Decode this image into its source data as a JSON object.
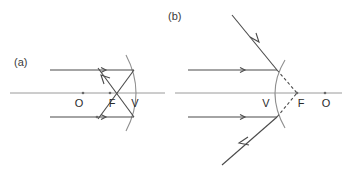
{
  "figure": {
    "width": 351,
    "height": 175,
    "background_color": "#ffffff",
    "line_color": "#4a4a4a",
    "axis_color": "#9a9a9a",
    "mirror_color": "#8f8f8f",
    "label_color": "#2b2b2b"
  },
  "panels": [
    {
      "id": "a",
      "label": "(a)",
      "mirror_type": "concave",
      "description": "Parallel rays reflect off a concave mirror and converge through the real focal point F between the vertex V and the center O.",
      "axis_label": "principal-axis",
      "points": [
        {
          "name": "O",
          "label": "O",
          "role": "center-of-curvature-side-point",
          "x": 83,
          "y": 93
        },
        {
          "name": "F",
          "label": "F",
          "role": "focal-point",
          "x": 110,
          "y": 93
        },
        {
          "name": "V",
          "label": "V",
          "role": "vertex",
          "x": 132,
          "y": 93
        }
      ],
      "rays": [
        {
          "name": "incident-ray-upper",
          "style": "solid",
          "direction": "rightward"
        },
        {
          "name": "incident-ray-lower",
          "style": "solid",
          "direction": "rightward"
        },
        {
          "name": "reflected-ray-upper",
          "style": "solid",
          "direction": "down-left-through-F"
        },
        {
          "name": "reflected-ray-lower",
          "style": "solid",
          "direction": "up-left-through-F"
        }
      ]
    },
    {
      "id": "b",
      "label": "(b)",
      "mirror_type": "convex",
      "description": "Parallel rays reflect off a convex mirror and diverge; their backward extensions (dashed) meet at the virtual focal point F behind the mirror, with O further right.",
      "axis_label": "principal-axis",
      "points": [
        {
          "name": "V",
          "label": "V",
          "role": "vertex",
          "x": 268,
          "y": 93
        },
        {
          "name": "F",
          "label": "F",
          "role": "virtual-focal-point",
          "x": 297,
          "y": 93
        },
        {
          "name": "O",
          "label": "O",
          "role": "center-of-curvature-side-point",
          "x": 325,
          "y": 93
        }
      ],
      "rays": [
        {
          "name": "incident-ray-upper",
          "style": "solid",
          "direction": "rightward"
        },
        {
          "name": "incident-ray-lower",
          "style": "solid",
          "direction": "rightward"
        },
        {
          "name": "reflected-ray-upper",
          "style": "solid",
          "direction": "up-left-diverging"
        },
        {
          "name": "reflected-ray-lower",
          "style": "solid",
          "direction": "down-left-diverging"
        },
        {
          "name": "virtual-ray-upper",
          "style": "dashed",
          "direction": "to-virtual-focus"
        },
        {
          "name": "virtual-ray-lower",
          "style": "dashed",
          "direction": "to-virtual-focus"
        }
      ]
    }
  ]
}
